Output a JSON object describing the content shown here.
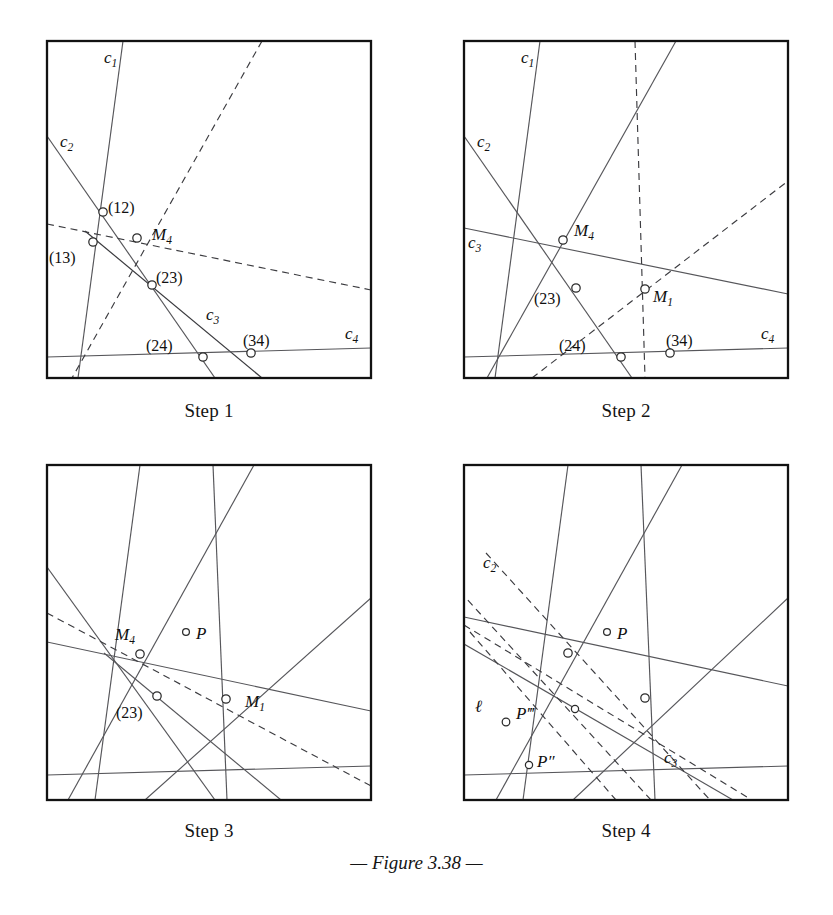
{
  "figure": {
    "caption": "— Figure 3.38 —",
    "caption_dash_left": "—",
    "caption_text": "Figure 3.38",
    "caption_dash_right": "—"
  },
  "panels": [
    {
      "id": "step1",
      "caption": "Step 1",
      "frame": {
        "x": 47,
        "y": 41,
        "w": 324,
        "h": 337
      },
      "labels": [
        {
          "name": "label-c1",
          "text": "c",
          "sub": "1",
          "x": 104,
          "y": 58,
          "style": "italic"
        },
        {
          "name": "label-c2",
          "text": "c",
          "sub": "2",
          "x": 60,
          "y": 142,
          "style": "italic"
        },
        {
          "name": "label-12",
          "text": "(12)",
          "sub": "",
          "x": 108,
          "y": 213,
          "style": "upright"
        },
        {
          "name": "label-M4",
          "text": "M",
          "sub": "4",
          "x": 152,
          "y": 238,
          "style": "italic"
        },
        {
          "name": "label-13",
          "text": "(13)",
          "sub": "",
          "x": 49,
          "y": 259,
          "style": "upright"
        },
        {
          "name": "label-23",
          "text": "(23)",
          "sub": "",
          "x": 156,
          "y": 283,
          "style": "upright"
        },
        {
          "name": "label-c3",
          "text": "c",
          "sub": "3",
          "x": 206,
          "y": 315,
          "style": "italic"
        },
        {
          "name": "label-24",
          "text": "(24)",
          "sub": "",
          "x": 146,
          "y": 347,
          "style": "upright"
        },
        {
          "name": "label-34",
          "text": "(34)",
          "sub": "",
          "x": 243,
          "y": 342,
          "style": "upright"
        },
        {
          "name": "label-c4",
          "text": "c",
          "sub": "4",
          "x": 345,
          "y": 334,
          "style": "italic"
        }
      ],
      "nodes": [
        {
          "name": "node-12",
          "x": 103,
          "y": 212
        },
        {
          "name": "node-M4",
          "x": 137,
          "y": 238
        },
        {
          "name": "node-13",
          "x": 93,
          "y": 242
        },
        {
          "name": "node-23",
          "x": 152,
          "y": 285
        },
        {
          "name": "node-24",
          "x": 203,
          "y": 357
        },
        {
          "name": "node-34",
          "x": 251,
          "y": 353
        }
      ]
    },
    {
      "id": "step2",
      "caption": "Step 2",
      "frame": {
        "x": 464,
        "y": 41,
        "w": 324,
        "h": 337
      },
      "labels": [
        {
          "name": "label-c1",
          "text": "c",
          "sub": "1",
          "x": 521,
          "y": 58,
          "style": "italic"
        },
        {
          "name": "label-c2",
          "text": "c",
          "sub": "2",
          "x": 477,
          "y": 142,
          "style": "italic"
        },
        {
          "name": "label-c3",
          "text": "c",
          "sub": "3",
          "x": 468,
          "y": 243,
          "style": "italic"
        },
        {
          "name": "label-M4",
          "text": "M",
          "sub": "4",
          "x": 574,
          "y": 234,
          "style": "italic"
        },
        {
          "name": "label-23",
          "text": "(23)",
          "sub": "",
          "x": 534,
          "y": 300,
          "style": "upright"
        },
        {
          "name": "label-M1",
          "text": "M",
          "sub": "1",
          "x": 653,
          "y": 299,
          "style": "italic"
        },
        {
          "name": "label-24",
          "text": "(24)",
          "sub": "",
          "x": 559,
          "y": 347,
          "style": "upright"
        },
        {
          "name": "label-34",
          "text": "(34)",
          "sub": "",
          "x": 666,
          "y": 342,
          "style": "upright"
        },
        {
          "name": "label-c4",
          "text": "c",
          "sub": "4",
          "x": 761,
          "y": 334,
          "style": "italic"
        }
      ],
      "nodes": [
        {
          "name": "node-M4",
          "x": 563,
          "y": 240
        },
        {
          "name": "node-23",
          "x": 576,
          "y": 288
        },
        {
          "name": "node-M1",
          "x": 645,
          "y": 289
        },
        {
          "name": "node-24",
          "x": 621,
          "y": 357
        },
        {
          "name": "node-34",
          "x": 670,
          "y": 353
        }
      ]
    },
    {
      "id": "step3",
      "caption": "Step 3",
      "frame": {
        "x": 47,
        "y": 465,
        "w": 324,
        "h": 335
      },
      "labels": [
        {
          "name": "label-M4",
          "text": "M",
          "sub": "4",
          "x": 115,
          "y": 634,
          "style": "italic"
        },
        {
          "name": "label-P",
          "text": "P",
          "sub": "",
          "x": 196,
          "y": 637,
          "style": "italic"
        },
        {
          "name": "label-M1",
          "text": "M",
          "sub": "1",
          "x": 245,
          "y": 703,
          "style": "italic"
        },
        {
          "name": "label-23",
          "text": "(23)",
          "sub": "",
          "x": 116,
          "y": 712,
          "style": "upright"
        }
      ],
      "nodes": [
        {
          "name": "node-M4",
          "x": 140,
          "y": 654
        },
        {
          "name": "node-P",
          "x": 186,
          "y": 632
        },
        {
          "name": "node-M1",
          "x": 226,
          "y": 699
        },
        {
          "name": "node-23",
          "x": 157,
          "y": 696
        }
      ]
    },
    {
      "id": "step4",
      "caption": "Step 4",
      "frame": {
        "x": 464,
        "y": 465,
        "w": 324,
        "h": 335
      },
      "labels": [
        {
          "name": "label-c2",
          "text": "c",
          "sub": "2",
          "x": 483,
          "y": 562,
          "style": "italic"
        },
        {
          "name": "label-P",
          "text": "P",
          "sub": "",
          "x": 617,
          "y": 637,
          "style": "italic"
        },
        {
          "name": "label-ell",
          "text": "ℓ",
          "sub": "",
          "x": 475,
          "y": 706,
          "style": "italic"
        },
        {
          "name": "label-Pppp",
          "text": "P‴",
          "sub": "",
          "x": 516,
          "y": 713,
          "style": "italic"
        },
        {
          "name": "label-Ppp",
          "text": "P″",
          "sub": "",
          "x": 537,
          "y": 761,
          "style": "italic"
        },
        {
          "name": "label-c3",
          "text": "c",
          "sub": "3",
          "x": 664,
          "y": 757,
          "style": "italic"
        }
      ],
      "nodes": [
        {
          "name": "node-M4",
          "x": 568,
          "y": 653
        },
        {
          "name": "node-P",
          "x": 607,
          "y": 632
        },
        {
          "name": "node-M1",
          "x": 645,
          "y": 698
        },
        {
          "name": "node-mid",
          "x": 575,
          "y": 709
        },
        {
          "name": "node-Pppp",
          "x": 506,
          "y": 722
        },
        {
          "name": "node-Ppp",
          "x": 529,
          "y": 765
        }
      ]
    }
  ],
  "geometry": {
    "step1": {
      "solid": [
        {
          "name": "line-c1",
          "x1": 123,
          "y1": 41,
          "x2": 78,
          "y2": 378
        },
        {
          "name": "line-c2",
          "x1": 47,
          "y1": 136,
          "x2": 215,
          "y2": 378
        },
        {
          "name": "line-c3",
          "x1": 85,
          "y1": 231,
          "x2": 262,
          "y2": 378
        },
        {
          "name": "line-c4",
          "x1": 47,
          "y1": 357,
          "x2": 371,
          "y2": 348
        }
      ],
      "dashed": [
        {
          "name": "line-d1",
          "x1": 262,
          "y1": 41,
          "x2": 72,
          "y2": 378
        },
        {
          "name": "line-d2",
          "x1": 47,
          "y1": 224,
          "x2": 371,
          "y2": 290
        }
      ]
    },
    "step2": {
      "solid": [
        {
          "name": "line-c1",
          "x1": 540,
          "y1": 41,
          "x2": 495,
          "y2": 378
        },
        {
          "name": "line-c2",
          "x1": 464,
          "y1": 136,
          "x2": 632,
          "y2": 378
        },
        {
          "name": "line-c3",
          "x1": 464,
          "y1": 228,
          "x2": 788,
          "y2": 294
        },
        {
          "name": "line-c4",
          "x1": 464,
          "y1": 357,
          "x2": 788,
          "y2": 348
        },
        {
          "name": "line-a1",
          "x1": 676,
          "y1": 41,
          "x2": 487,
          "y2": 378
        }
      ],
      "dashed": [
        {
          "name": "line-d1",
          "x1": 635,
          "y1": 41,
          "x2": 645,
          "y2": 378
        },
        {
          "name": "line-d2",
          "x1": 532,
          "y1": 378,
          "x2": 788,
          "y2": 181
        }
      ]
    },
    "step3": {
      "solid": [
        {
          "name": "line-a",
          "x1": 140,
          "y1": 465,
          "x2": 95,
          "y2": 800
        },
        {
          "name": "line-b",
          "x1": 47,
          "y1": 567,
          "x2": 215,
          "y2": 800
        },
        {
          "name": "line-c",
          "x1": 47,
          "y1": 642,
          "x2": 371,
          "y2": 711
        },
        {
          "name": "line-d",
          "x1": 47,
          "y1": 775,
          "x2": 371,
          "y2": 766
        },
        {
          "name": "line-e",
          "x1": 254,
          "y1": 465,
          "x2": 68,
          "y2": 800
        },
        {
          "name": "line-f",
          "x1": 213,
          "y1": 465,
          "x2": 227,
          "y2": 800
        },
        {
          "name": "line-g",
          "x1": 104,
          "y1": 653,
          "x2": 281,
          "y2": 800
        },
        {
          "name": "line-h",
          "x1": 371,
          "y1": 598,
          "x2": 145,
          "y2": 800
        }
      ],
      "dashed": [
        {
          "name": "line-d1",
          "x1": 47,
          "y1": 613,
          "x2": 371,
          "y2": 786
        }
      ]
    },
    "step4": {
      "solid": [
        {
          "name": "line-a",
          "x1": 568,
          "y1": 465,
          "x2": 523,
          "y2": 800
        },
        {
          "name": "line-b",
          "x1": 464,
          "y1": 617,
          "x2": 788,
          "y2": 686
        },
        {
          "name": "line-c",
          "x1": 464,
          "y1": 775,
          "x2": 788,
          "y2": 766
        },
        {
          "name": "line-e",
          "x1": 682,
          "y1": 465,
          "x2": 496,
          "y2": 800
        },
        {
          "name": "line-f",
          "x1": 641,
          "y1": 465,
          "x2": 655,
          "y2": 800
        },
        {
          "name": "line-h",
          "x1": 788,
          "y1": 598,
          "x2": 573,
          "y2": 800
        },
        {
          "name": "line-i",
          "x1": 464,
          "y1": 644,
          "x2": 733,
          "y2": 800
        }
      ],
      "dashed": [
        {
          "name": "line-c2",
          "x1": 486,
          "y1": 553,
          "x2": 710,
          "y2": 800
        },
        {
          "name": "line-ell",
          "x1": 470,
          "y1": 632,
          "x2": 616,
          "y2": 800
        },
        {
          "name": "line-d3",
          "x1": 464,
          "y1": 625,
          "x2": 752,
          "y2": 800
        },
        {
          "name": "line-d4",
          "x1": 651,
          "y1": 800,
          "x2": 464,
          "y2": 596
        }
      ]
    }
  }
}
